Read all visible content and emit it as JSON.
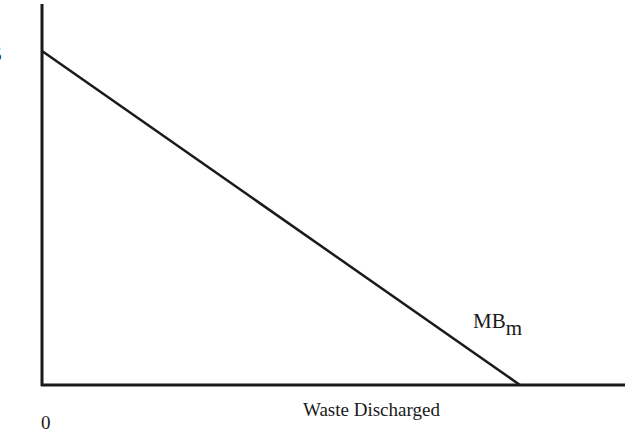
{
  "diagram": {
    "type": "marginal-benefit-curve",
    "y_axis_label": "$",
    "x_axis_label": "Waste Discharged",
    "origin_label": "0",
    "curve": {
      "label_main": "MB",
      "label_sub": "m",
      "start": {
        "x": 42,
        "y": 51
      },
      "end": {
        "x": 520,
        "y": 385
      }
    },
    "axes": {
      "origin": {
        "x": 42,
        "y": 385
      },
      "y_top": 4,
      "x_right": 625
    },
    "colors": {
      "line": "#1a1a1a",
      "background": "#ffffff"
    }
  }
}
